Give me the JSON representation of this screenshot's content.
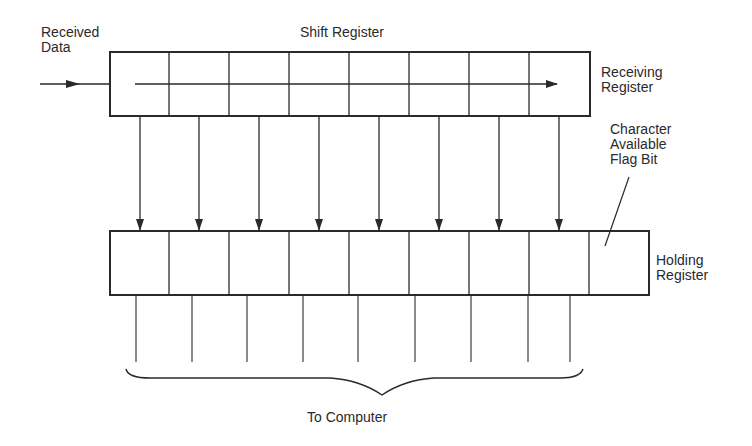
{
  "labels": {
    "received_data": "Received\nData",
    "shift_register": "Shift Register",
    "receiving_register": "Receiving\nRegister",
    "flag_bit": "Character\nAvailable\nFlag Bit",
    "holding_register": "Holding\nRegister",
    "to_computer": "To Computer"
  },
  "receiving_register": {
    "cells": 8
  },
  "holding_register": {
    "cells": 9
  },
  "colors": {
    "stroke": "#2a2a2a",
    "background": "#ffffff"
  }
}
